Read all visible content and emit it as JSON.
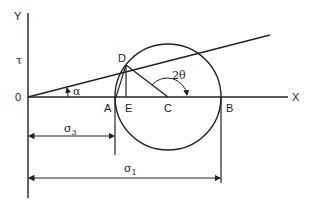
{
  "axes": {
    "x_label": "X",
    "y_label": "Y",
    "origin_label": "0",
    "tau_label": "τ"
  },
  "points": {
    "A": "A",
    "B": "B",
    "C": "C",
    "D": "D",
    "E": "E"
  },
  "angles": {
    "alpha": "α",
    "two_theta": "2θ"
  },
  "dimensions": {
    "sigma3": {
      "symbol": "σ",
      "subscript": "3"
    },
    "sigma1": {
      "symbol": "σ",
      "subscript": "1"
    }
  },
  "colors": {
    "line": "#222222",
    "background": "#ffffff"
  }
}
